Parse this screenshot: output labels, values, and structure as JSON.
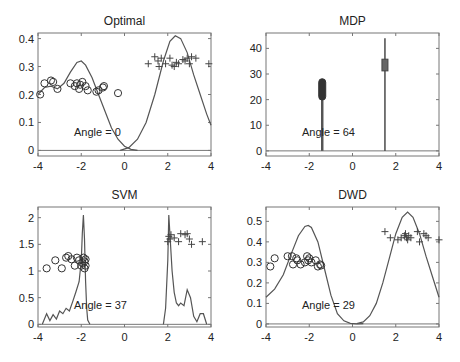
{
  "chart_data": [
    {
      "type": "line",
      "title": "Optimal",
      "annotation": "Angle = 0",
      "xlim": [
        -4,
        4
      ],
      "ylim": [
        -0.02,
        0.42
      ],
      "xticks": [
        -4,
        -2,
        0,
        2,
        4
      ],
      "yticks": [
        0,
        0.1,
        0.2,
        0.3,
        0.4
      ],
      "ytick_labels": [
        "0",
        "0.1",
        "0.2",
        "0.3",
        "0.4"
      ],
      "series": [
        {
          "name": "density-class-1",
          "x": [
            -4,
            -3.7,
            -3.4,
            -3.1,
            -2.8,
            -2.5,
            -2.2,
            -2.0,
            -1.8,
            -1.5,
            -1.2,
            -0.9,
            -0.6,
            -0.3,
            0,
            0.3,
            0.6
          ],
          "y": [
            0.2,
            0.225,
            0.23,
            0.22,
            0.24,
            0.28,
            0.315,
            0.32,
            0.305,
            0.26,
            0.2,
            0.14,
            0.08,
            0.04,
            0.015,
            0.004,
            0
          ]
        },
        {
          "name": "density-class-2",
          "x": [
            -0.2,
            0.2,
            0.6,
            1.0,
            1.4,
            1.8,
            2.1,
            2.35,
            2.6,
            2.9,
            3.2,
            3.5,
            3.8,
            4.0
          ],
          "y": [
            0,
            0.01,
            0.04,
            0.1,
            0.2,
            0.32,
            0.39,
            0.41,
            0.4,
            0.35,
            0.27,
            0.2,
            0.13,
            0.09
          ]
        },
        {
          "name": "class-1-points",
          "marker": "circle",
          "x": [
            -3.9,
            -3.7,
            -3.4,
            -3.3,
            -3.1,
            -2.5,
            -2.3,
            -2.2,
            -2.1,
            -2.05,
            -1.95,
            -1.8,
            -1.7,
            -1.3,
            -1.2,
            -1.0,
            -0.95,
            -0.3
          ],
          "y": [
            0.2,
            0.24,
            0.25,
            0.245,
            0.22,
            0.24,
            0.23,
            0.24,
            0.22,
            0.235,
            0.245,
            0.23,
            0.215,
            0.21,
            0.215,
            0.225,
            0.23,
            0.205
          ]
        },
        {
          "name": "class-2-points",
          "marker": "plus",
          "x": [
            1.1,
            1.4,
            1.55,
            1.6,
            1.7,
            1.9,
            2.1,
            2.2,
            2.3,
            2.4,
            2.5,
            2.7,
            2.8,
            2.9,
            3.0,
            3.1,
            3.3,
            3.9
          ],
          "y": [
            0.31,
            0.335,
            0.32,
            0.3,
            0.33,
            0.31,
            0.33,
            0.305,
            0.3,
            0.315,
            0.31,
            0.325,
            0.32,
            0.33,
            0.31,
            0.335,
            0.33,
            0.31
          ]
        }
      ]
    },
    {
      "type": "line",
      "title": "MDP",
      "annotation": "Angle = 64",
      "xlim": [
        -4,
        4
      ],
      "ylim": [
        -2,
        46
      ],
      "xticks": [
        -4,
        -2,
        0,
        2,
        4
      ],
      "yticks": [
        0,
        10,
        20,
        30,
        40
      ],
      "ytick_labels": [
        "0",
        "10",
        "20",
        "30",
        "40"
      ],
      "series": [
        {
          "name": "density-class-1",
          "x": [
            -1.4,
            -1.4
          ],
          "y": [
            0,
            27
          ]
        },
        {
          "name": "density-class-2",
          "x": [
            1.5,
            1.5
          ],
          "y": [
            0,
            44
          ]
        },
        {
          "name": "class-1-points",
          "marker": "circle",
          "x": [
            -1.4
          ],
          "y_range": [
            21,
            27
          ]
        },
        {
          "name": "class-2-points",
          "marker": "plus",
          "x": [
            1.5
          ],
          "y_range": [
            32,
            35
          ]
        }
      ]
    },
    {
      "type": "line",
      "title": "SVM",
      "annotation": "Angle = 37",
      "xlim": [
        -4,
        4
      ],
      "ylim": [
        -0.05,
        2.2
      ],
      "xticks": [
        -4,
        -2,
        0,
        2,
        4
      ],
      "yticks": [
        0,
        0.5,
        1,
        1.5,
        2
      ],
      "ytick_labels": [
        "0",
        "0.5",
        "1",
        "1.5",
        "2"
      ],
      "series": [
        {
          "name": "density-class-1",
          "x": [
            -3.8,
            -3.6,
            -3.45,
            -3.3,
            -3.15,
            -3.0,
            -2.85,
            -2.7,
            -2.55,
            -2.4,
            -2.25,
            -2.1,
            -2.0,
            -1.95,
            -1.9,
            -1.85,
            -1.8,
            -1.75,
            -1.7,
            -1.6
          ],
          "y": [
            0,
            0.2,
            0.07,
            0.18,
            0.1,
            0.25,
            0.2,
            0.3,
            0.25,
            0.42,
            0.6,
            0.8,
            1.2,
            1.7,
            2.05,
            1.6,
            0.8,
            0.3,
            0.08,
            0
          ]
        },
        {
          "name": "density-class-2",
          "x": [
            1.8,
            1.9,
            2.0,
            2.05,
            2.1,
            2.2,
            2.3,
            2.4,
            2.5,
            2.6,
            2.75,
            2.9,
            3.05,
            3.2,
            3.35,
            3.5,
            3.65,
            3.8
          ],
          "y": [
            0,
            0.3,
            1.2,
            2.05,
            1.7,
            1.0,
            0.6,
            0.4,
            0.35,
            0.4,
            0.35,
            0.65,
            0.5,
            0.15,
            0.05,
            0.2,
            0.2,
            0
          ]
        },
        {
          "name": "class-1-points",
          "marker": "circle",
          "x": [
            -3.6,
            -3.2,
            -2.9,
            -2.7,
            -2.6,
            -2.45,
            -2.3,
            -2.2,
            -2.1,
            -2.0,
            -1.95,
            -1.9,
            -1.85,
            -1.85,
            -1.8,
            -1.8
          ],
          "y": [
            1.05,
            1.2,
            1.05,
            1.25,
            1.28,
            1.22,
            1.1,
            1.25,
            1.2,
            1.1,
            1.15,
            1.25,
            1.05,
            1.18,
            1.1,
            1.22
          ]
        },
        {
          "name": "class-2-points",
          "marker": "plus",
          "x": [
            2.0,
            2.05,
            2.1,
            2.15,
            2.3,
            2.5,
            2.6,
            2.8,
            2.9,
            3.0,
            3.1,
            3.6
          ],
          "y": [
            1.55,
            1.65,
            1.6,
            1.68,
            1.62,
            1.55,
            1.7,
            1.68,
            1.7,
            1.6,
            1.5,
            1.55
          ]
        }
      ]
    },
    {
      "type": "line",
      "title": "DWD",
      "annotation": "Angle = 29",
      "xlim": [
        -4,
        4
      ],
      "ylim": [
        -0.015,
        0.57
      ],
      "xticks": [
        -4,
        -2,
        0,
        2,
        4
      ],
      "yticks": [
        0,
        0.1,
        0.2,
        0.3,
        0.4,
        0.5
      ],
      "ytick_labels": [
        "0",
        "0.1",
        "0.2",
        "0.3",
        "0.4",
        "0.5"
      ],
      "series": [
        {
          "name": "density-class-1",
          "x": [
            -4,
            -3.6,
            -3.2,
            -2.8,
            -2.5,
            -2.2,
            -2.05,
            -1.9,
            -1.6,
            -1.3,
            -1.0,
            -0.7,
            -0.4,
            -0.1,
            0.2,
            0.5
          ],
          "y": [
            0.13,
            0.17,
            0.24,
            0.35,
            0.43,
            0.475,
            0.48,
            0.47,
            0.4,
            0.27,
            0.14,
            0.05,
            0.015,
            0.003,
            0,
            0.001
          ]
        },
        {
          "name": "density-class-2",
          "x": [
            0.2,
            0.5,
            0.8,
            1.1,
            1.4,
            1.7,
            2.0,
            2.3,
            2.55,
            2.8,
            3.1,
            3.4,
            3.7,
            4.0
          ],
          "y": [
            0.002,
            0.01,
            0.04,
            0.1,
            0.2,
            0.32,
            0.44,
            0.52,
            0.545,
            0.52,
            0.44,
            0.33,
            0.23,
            0.13
          ]
        },
        {
          "name": "class-1-points",
          "marker": "circle",
          "x": [
            -3.8,
            -3.6,
            -3.0,
            -2.8,
            -2.75,
            -2.6,
            -2.55,
            -2.4,
            -2.2,
            -2.1,
            -2.05,
            -2.0,
            -1.9,
            -1.7,
            -1.6,
            -1.5,
            -1.45
          ],
          "y": [
            0.28,
            0.32,
            0.33,
            0.33,
            0.29,
            0.32,
            0.31,
            0.29,
            0.3,
            0.33,
            0.31,
            0.32,
            0.3,
            0.31,
            0.28,
            0.29,
            0.285
          ]
        },
        {
          "name": "class-2-points",
          "marker": "plus",
          "x": [
            1.5,
            1.75,
            2.1,
            2.25,
            2.4,
            2.45,
            2.5,
            2.55,
            2.6,
            2.7,
            3.0,
            3.1,
            3.3,
            3.4,
            3.5,
            4.0
          ],
          "y": [
            0.45,
            0.42,
            0.41,
            0.42,
            0.43,
            0.44,
            0.42,
            0.41,
            0.43,
            0.42,
            0.45,
            0.4,
            0.44,
            0.43,
            0.42,
            0.41
          ]
        }
      ]
    }
  ]
}
